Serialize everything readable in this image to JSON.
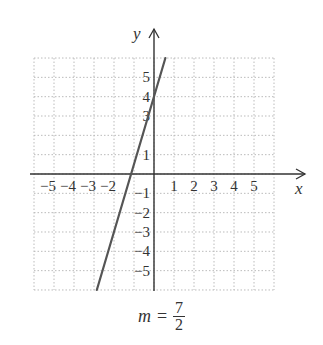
{
  "chart_data": {
    "type": "line",
    "title": "",
    "xlabel": "x",
    "ylabel": "y",
    "xlim": [
      -6,
      6
    ],
    "ylim": [
      -6,
      6
    ],
    "grid": true,
    "x_ticks": [
      -5,
      -4,
      -3,
      -2,
      1,
      2,
      3,
      4,
      5
    ],
    "x_tick_labels": [
      "−5",
      "−4",
      "−3",
      "−2",
      "1",
      "2",
      "3",
      "4",
      "5"
    ],
    "y_ticks": [
      5,
      4,
      3,
      1,
      -1,
      -2,
      -3,
      -4,
      -5
    ],
    "y_tick_labels": [
      "5",
      "4",
      "3",
      "1",
      "−1",
      "−2",
      "−3",
      "−4",
      "−5"
    ],
    "series": [
      {
        "name": "line",
        "equation": "y = 7/2 x + 4",
        "slope": 3.5,
        "intercept": 4,
        "x": [
          -2.86,
          0.57
        ],
        "y": [
          -6,
          6
        ],
        "color": "#555555"
      }
    ],
    "annotations": [
      {
        "text": "m = 7/2",
        "position": "below"
      }
    ]
  },
  "caption": {
    "variable": "m",
    "equals": "=",
    "numerator": "7",
    "denominator": "2"
  },
  "colors": {
    "axis": "#333333",
    "grid": "#bbbbbb",
    "line": "#555555"
  }
}
